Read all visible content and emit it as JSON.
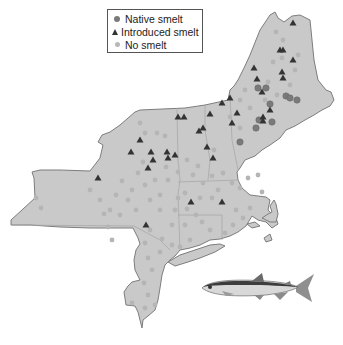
{
  "legend": {
    "items": [
      {
        "label": "Native smelt",
        "symbol": "circle-dark"
      },
      {
        "label": "Introduced smelt",
        "symbol": "triangle"
      },
      {
        "label": "No smelt",
        "symbol": "circle-light"
      }
    ]
  },
  "colors": {
    "land_fill": "#c9c9c9",
    "land_stroke": "#7d7d7d",
    "state_border": "#a8a8a8",
    "native": "#7a7a7a",
    "introduced": "#333333",
    "none": "#b5b5b5"
  },
  "region": "Northeastern United States (NY, NJ, PA-edge, CT, RI, MA, VT, NH, ME)",
  "points": {
    "native": [
      [
        258,
        88
      ],
      [
        266,
        88
      ],
      [
        270,
        104
      ],
      [
        286,
        96
      ],
      [
        290,
        98
      ],
      [
        297,
        100
      ],
      [
        272,
        122
      ],
      [
        259,
        120
      ],
      [
        256,
        128
      ],
      [
        240,
        142
      ]
    ],
    "introduced": [
      [
        293,
        23
      ],
      [
        280,
        50
      ],
      [
        283,
        50
      ],
      [
        293,
        60
      ],
      [
        254,
        68
      ],
      [
        282,
        72
      ],
      [
        283,
        78
      ],
      [
        257,
        79
      ],
      [
        262,
        92
      ],
      [
        230,
        98
      ],
      [
        237,
        113
      ],
      [
        263,
        117
      ],
      [
        263,
        121
      ],
      [
        232,
        123
      ],
      [
        270,
        110
      ],
      [
        222,
        103
      ],
      [
        210,
        114
      ],
      [
        203,
        128
      ],
      [
        178,
        117
      ],
      [
        199,
        131
      ],
      [
        184,
        117
      ],
      [
        207,
        147
      ],
      [
        213,
        158
      ],
      [
        175,
        155
      ],
      [
        140,
        140
      ],
      [
        131,
        152
      ],
      [
        151,
        152
      ],
      [
        167,
        152
      ],
      [
        153,
        160
      ],
      [
        148,
        168
      ],
      [
        168,
        158
      ],
      [
        98,
        178
      ],
      [
        146,
        225
      ],
      [
        191,
        202
      ],
      [
        222,
        202
      ]
    ],
    "none": [
      [
        283,
        40
      ],
      [
        276,
        32
      ],
      [
        282,
        58
      ],
      [
        298,
        55
      ],
      [
        273,
        62
      ],
      [
        295,
        70
      ],
      [
        268,
        82
      ],
      [
        277,
        95
      ],
      [
        290,
        85
      ],
      [
        245,
        90
      ],
      [
        250,
        108
      ],
      [
        240,
        128
      ],
      [
        265,
        100
      ],
      [
        230,
        117
      ],
      [
        240,
        100
      ],
      [
        214,
        150
      ],
      [
        223,
        173
      ],
      [
        212,
        176
      ],
      [
        203,
        183
      ],
      [
        212,
        198
      ],
      [
        232,
        183
      ],
      [
        240,
        188
      ],
      [
        248,
        178
      ],
      [
        258,
        175
      ],
      [
        262,
        192
      ],
      [
        250,
        208
      ],
      [
        243,
        218
      ],
      [
        236,
        210
      ],
      [
        233,
        225
      ],
      [
        225,
        233
      ],
      [
        210,
        230
      ],
      [
        202,
        222
      ],
      [
        196,
        215
      ],
      [
        187,
        209
      ],
      [
        200,
        198
      ],
      [
        185,
        193
      ],
      [
        178,
        198
      ],
      [
        175,
        210
      ],
      [
        185,
        225
      ],
      [
        190,
        240
      ],
      [
        172,
        225
      ],
      [
        160,
        210
      ],
      [
        160,
        195
      ],
      [
        168,
        180
      ],
      [
        155,
        180
      ],
      [
        150,
        200
      ],
      [
        145,
        185
      ],
      [
        138,
        173
      ],
      [
        132,
        190
      ],
      [
        122,
        181
      ],
      [
        116,
        195
      ],
      [
        110,
        210
      ],
      [
        120,
        215
      ],
      [
        108,
        227
      ],
      [
        100,
        200
      ],
      [
        90,
        190
      ],
      [
        128,
        200
      ],
      [
        136,
        210
      ],
      [
        150,
        230
      ],
      [
        145,
        243
      ],
      [
        148,
        258
      ],
      [
        160,
        252
      ],
      [
        152,
        270
      ],
      [
        144,
        283
      ],
      [
        148,
        295
      ],
      [
        132,
        303
      ],
      [
        145,
        308
      ],
      [
        155,
        305
      ],
      [
        36,
        198
      ],
      [
        41,
        208
      ],
      [
        104,
        214
      ],
      [
        112,
        240
      ],
      [
        162,
        239
      ],
      [
        172,
        245
      ],
      [
        180,
        247
      ],
      [
        140,
        123
      ],
      [
        145,
        133
      ],
      [
        157,
        133
      ],
      [
        165,
        136
      ],
      [
        143,
        162
      ],
      [
        178,
        172
      ],
      [
        166,
        167
      ],
      [
        198,
        166
      ],
      [
        187,
        160
      ],
      [
        193,
        175
      ],
      [
        218,
        190
      ]
    ]
  },
  "illustration": {
    "subject": "smelt-fish"
  }
}
